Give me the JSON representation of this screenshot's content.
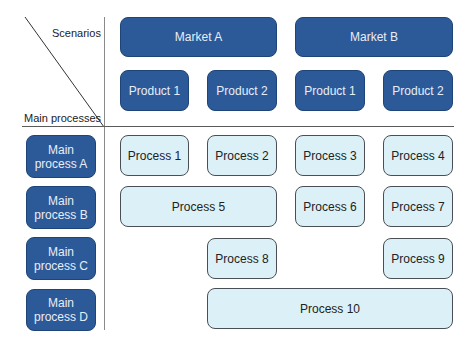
{
  "header": {
    "scenarios_label": "Scenarios",
    "main_processes_label": "Main processes"
  },
  "markets": [
    {
      "label": "Market A",
      "products": [
        "Product 1",
        "Product 2"
      ]
    },
    {
      "label": "Market B",
      "products": [
        "Product 1",
        "Product 2"
      ]
    }
  ],
  "main_processes": [
    "Main process A",
    "Main process B",
    "Main process C",
    "Main process D"
  ],
  "main_process_lines": [
    [
      "Main",
      "process A"
    ],
    [
      "Main",
      "process B"
    ],
    [
      "Main",
      "process C"
    ],
    [
      "Main",
      "process D"
    ]
  ],
  "processes": [
    {
      "label": "Process 1",
      "row": "A",
      "columns": [
        "Market A / Product 1"
      ]
    },
    {
      "label": "Process 2",
      "row": "A",
      "columns": [
        "Market A / Product 2"
      ]
    },
    {
      "label": "Process 3",
      "row": "A",
      "columns": [
        "Market B / Product 1"
      ]
    },
    {
      "label": "Process 4",
      "row": "A",
      "columns": [
        "Market B / Product 2"
      ]
    },
    {
      "label": "Process 5",
      "row": "B",
      "columns": [
        "Market A / Product 1",
        "Market A / Product 2"
      ]
    },
    {
      "label": "Process 6",
      "row": "B",
      "columns": [
        "Market B / Product 1"
      ]
    },
    {
      "label": "Process 7",
      "row": "B",
      "columns": [
        "Market B / Product 2"
      ]
    },
    {
      "label": "Process 8",
      "row": "C",
      "columns": [
        "Market A / Product 2"
      ]
    },
    {
      "label": "Process 9",
      "row": "C",
      "columns": [
        "Market B / Product 2"
      ]
    },
    {
      "label": "Process 10",
      "row": "D",
      "columns": [
        "Market A / Product 2",
        "Market B / Product 1",
        "Market B / Product 2"
      ]
    }
  ],
  "colors": {
    "dark_box": "#2c5998",
    "light_box": "#dcf1f7",
    "light_border": "#4a4f55"
  }
}
